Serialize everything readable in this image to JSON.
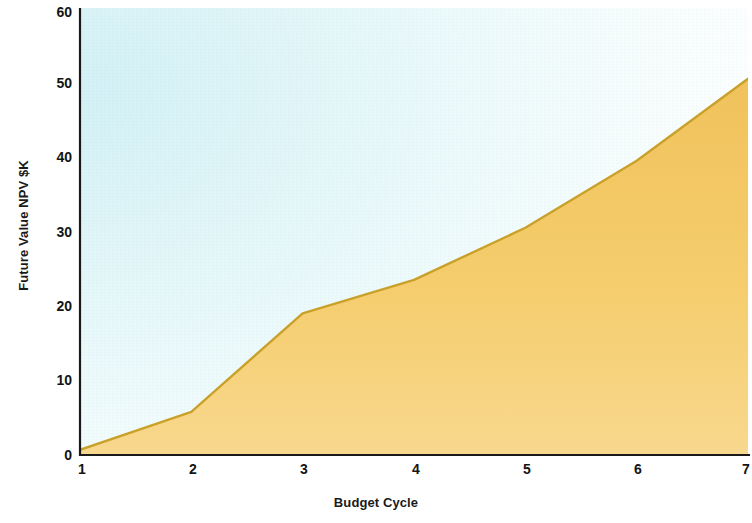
{
  "chart_data": {
    "type": "area",
    "title": "",
    "xlabel": "Budget Cycle",
    "ylabel": "Future Value NPV $K",
    "x": [
      1,
      2,
      3,
      4,
      5,
      6,
      7
    ],
    "categories": [
      "1",
      "2",
      "3",
      "4",
      "5",
      "6",
      "7"
    ],
    "values": [
      0.7,
      5.8,
      19.0,
      23.5,
      30.5,
      39.5,
      50.5
    ],
    "series": [
      {
        "name": "Future Value NPV $K",
        "values": [
          0.7,
          5.8,
          19.0,
          23.5,
          30.5,
          39.5,
          50.5
        ]
      }
    ],
    "xlim": [
      1,
      7
    ],
    "ylim": [
      0,
      60
    ],
    "ytick_labels": [
      "0",
      "10",
      "20",
      "30",
      "40",
      "50",
      "60"
    ],
    "yticks": [
      0,
      10,
      20,
      30,
      40,
      50,
      60
    ],
    "xtick_labels": [
      "1",
      "2",
      "3",
      "4",
      "5",
      "6",
      "7"
    ],
    "xticks": [
      1,
      2,
      3,
      4,
      5,
      6,
      7
    ],
    "grid": false,
    "legend": "none",
    "colors": {
      "area_fill_top": "#f2c661",
      "area_fill_bottom": "#f8d88c",
      "line_stroke": "#c9a12a",
      "plot_bg_start": "#d2f1f6",
      "plot_bg_end": "#ffffff",
      "axis": "#1a1a1a",
      "text": "#141414"
    }
  },
  "axes": {
    "y_title": "Future Value NPV $K",
    "x_title": "Budget Cycle",
    "y_tick_0": "0",
    "y_tick_1": "10",
    "y_tick_2": "20",
    "y_tick_3": "30",
    "y_tick_4": "40",
    "y_tick_5": "50",
    "y_tick_6": "60",
    "x_tick_0": "1",
    "x_tick_1": "2",
    "x_tick_2": "3",
    "x_tick_3": "4",
    "x_tick_4": "5",
    "x_tick_5": "6",
    "x_tick_6": "7"
  }
}
